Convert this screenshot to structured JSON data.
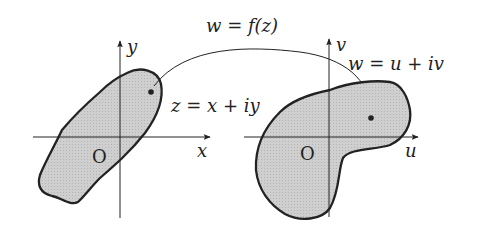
{
  "diagram": {
    "mapping_label": "w = f(z)",
    "z_plane": {
      "x_axis_label": "x",
      "y_axis_label": "y",
      "origin_label": "O",
      "point_label": "z = x + iy"
    },
    "w_plane": {
      "x_axis_label": "u",
      "y_axis_label": "v",
      "origin_label": "O",
      "point_label": "w = u + iv"
    },
    "colors": {
      "region_fill": "#c8c8c8",
      "stroke": "#222222"
    }
  }
}
